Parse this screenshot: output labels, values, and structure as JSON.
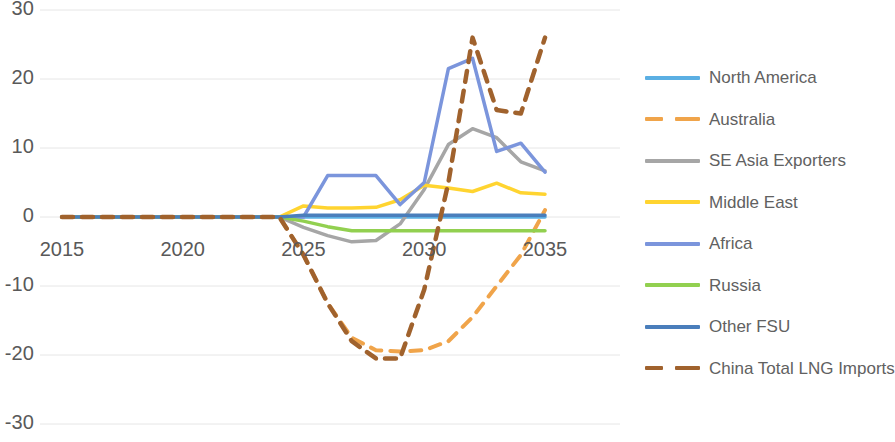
{
  "chart_data": {
    "type": "line",
    "title": "",
    "subtitle": "",
    "xlabel": "",
    "ylabel": "",
    "xlim": [
      2015,
      2035
    ],
    "ylim": [
      -30,
      30
    ],
    "grid": true,
    "grid_axis": "y",
    "legend_position": "right",
    "x": [
      2015,
      2016,
      2017,
      2018,
      2019,
      2020,
      2021,
      2022,
      2023,
      2024,
      2025,
      2026,
      2027,
      2028,
      2029,
      2030,
      2031,
      2032,
      2033,
      2034,
      2035
    ],
    "xtick_labels": [
      "2015",
      "2020",
      "2025",
      "2030",
      "2035"
    ],
    "xtick_values": [
      2015,
      2020,
      2025,
      2030,
      2035
    ],
    "ytick_labels": [
      "30",
      "20",
      "10",
      "0",
      "-10",
      "-20",
      "-30"
    ],
    "ytick_values": [
      30,
      20,
      10,
      0,
      -10,
      -20,
      -30
    ],
    "series": [
      {
        "name": "North America",
        "color": "#5BAFE3",
        "dash": "solid",
        "width": 3.5,
        "values": [
          0,
          0,
          0,
          0,
          0,
          0,
          0,
          0,
          0,
          0,
          0,
          0,
          0,
          0,
          0,
          0,
          0,
          0,
          0,
          0,
          0
        ]
      },
      {
        "name": "Australia",
        "color": "#F0A44A",
        "dash": "dashed",
        "width": 4,
        "values": [
          0,
          0,
          0,
          0,
          0,
          0,
          0,
          0,
          0,
          0,
          -5.5,
          -12.5,
          -17.5,
          -19.3,
          -19.5,
          -19.3,
          -18.0,
          -14.5,
          -10.0,
          -5.5,
          1.0
        ]
      },
      {
        "name": "SE Asia Exporters",
        "color": "#A6A6A6",
        "dash": "solid",
        "width": 3.5,
        "values": [
          0,
          0,
          0,
          0,
          0,
          0,
          0,
          0,
          0,
          0,
          -1.5,
          -2.7,
          -3.6,
          -3.4,
          -1.0,
          4.0,
          10.5,
          12.8,
          11.5,
          8.0,
          6.7
        ]
      },
      {
        "name": "Middle East",
        "color": "#FFD430",
        "dash": "solid",
        "width": 3.5,
        "values": [
          0,
          0,
          0,
          0,
          0,
          0,
          0,
          0,
          0,
          0,
          1.6,
          1.3,
          1.3,
          1.4,
          2.5,
          4.6,
          4.2,
          3.7,
          4.9,
          3.5,
          3.3
        ]
      },
      {
        "name": "Africa",
        "color": "#7B95DC",
        "dash": "solid",
        "width": 3.5,
        "values": [
          0,
          0,
          0,
          0,
          0,
          0,
          0,
          0,
          0,
          0,
          0.0,
          6.0,
          6.0,
          6.0,
          1.8,
          5.0,
          21.5,
          23.0,
          9.5,
          10.7,
          6.5
        ]
      },
      {
        "name": "Russia",
        "color": "#92D050",
        "dash": "solid",
        "width": 3.5,
        "values": [
          0,
          0,
          0,
          0,
          0,
          0,
          0,
          0,
          0,
          0,
          -0.6,
          -1.4,
          -2.0,
          -2.0,
          -2.0,
          -2.0,
          -2.0,
          -2.0,
          -2.0,
          -2.0,
          -2.0
        ]
      },
      {
        "name": "Other FSU",
        "color": "#4A7EBB",
        "dash": "solid",
        "width": 3.5,
        "values": [
          0,
          0,
          0,
          0,
          0,
          0,
          0,
          0,
          0,
          0,
          0.25,
          0.25,
          0.25,
          0.25,
          0.25,
          0.25,
          0.25,
          0.25,
          0.25,
          0.25,
          0.25
        ]
      },
      {
        "name": "China Total LNG Imports",
        "color": "#A0622D",
        "dash": "dashed",
        "width": 4.5,
        "values": [
          0,
          0,
          0,
          0,
          0,
          0,
          0,
          0,
          0,
          0,
          -5.5,
          -12.5,
          -18.0,
          -20.5,
          -20.5,
          -10.5,
          5.0,
          26.0,
          15.5,
          15.0,
          26.0
        ]
      }
    ]
  },
  "legend": {
    "items": [
      {
        "label": "North America",
        "color": "#5BAFE3",
        "dash": "solid"
      },
      {
        "label": "Australia",
        "color": "#F0A44A",
        "dash": "dashed"
      },
      {
        "label": "SE Asia Exporters",
        "color": "#A6A6A6",
        "dash": "solid"
      },
      {
        "label": "Middle East",
        "color": "#FFD430",
        "dash": "solid"
      },
      {
        "label": "Africa",
        "color": "#7B95DC",
        "dash": "solid"
      },
      {
        "label": "Russia",
        "color": "#92D050",
        "dash": "solid"
      },
      {
        "label": "Other FSU",
        "color": "#4A7EBB",
        "dash": "solid"
      },
      {
        "label": "China Total LNG Imports",
        "color": "#A0622D",
        "dash": "dashed"
      }
    ]
  },
  "axes": {
    "gridline_color": "#E6E6E6",
    "tick_text_color": "#595959",
    "zero_line_visible": false
  }
}
